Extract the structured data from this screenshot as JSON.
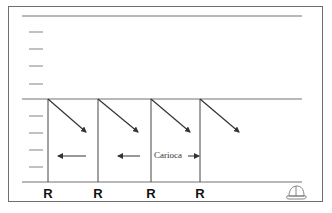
{
  "diagram": {
    "title": "",
    "labels": {
      "receivers": [
        "R",
        "R",
        "R",
        "R"
      ],
      "movement": "Carioca"
    },
    "colors": {
      "field_lines": "#9a9a9a",
      "route_lines": "#333333",
      "frame": "#6e6e6e"
    },
    "icons": {
      "cap": "coach-cap-icon"
    }
  }
}
